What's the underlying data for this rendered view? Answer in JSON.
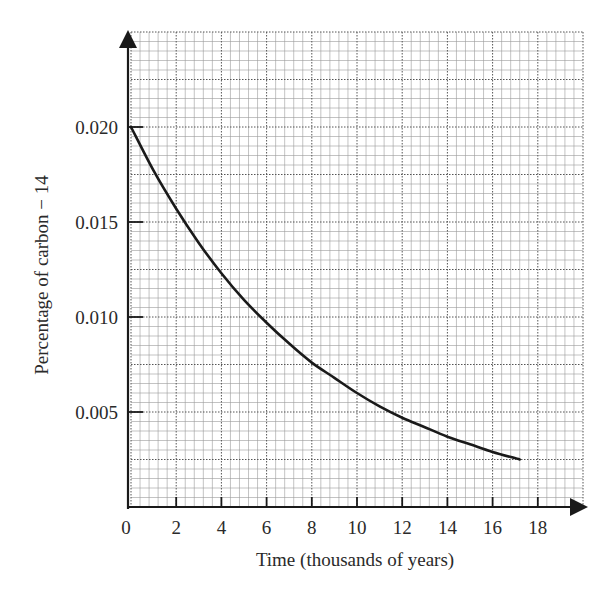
{
  "chart_data": {
    "type": "line",
    "title": "",
    "xlabel": "Time (thousands of years)",
    "ylabel": "Percentage of carbon − 14",
    "xlim": [
      0,
      20
    ],
    "ylim": [
      0,
      0.025
    ],
    "grid": true,
    "legend": null,
    "x_ticks": [
      0,
      2,
      4,
      6,
      8,
      10,
      12,
      14,
      16,
      18
    ],
    "x_tick_labels": [
      "0",
      "2",
      "4",
      "6",
      "8",
      "10",
      "12",
      "14",
      "16",
      "18"
    ],
    "y_ticks": [
      0.005,
      0.01,
      0.015,
      0.02
    ],
    "y_tick_labels": [
      "0.005",
      "0.010",
      "0.015",
      "0.020"
    ],
    "series": [
      {
        "name": "Carbon-14 decay",
        "x": [
          0,
          1,
          2,
          3,
          4,
          5,
          6,
          7,
          8,
          9,
          10,
          11,
          12,
          13,
          14,
          15,
          16,
          17.2
        ],
        "y": [
          0.02,
          0.0177,
          0.0157,
          0.0139,
          0.0123,
          0.0109,
          0.0097,
          0.0086,
          0.0076,
          0.0068,
          0.006,
          0.0053,
          0.0047,
          0.0042,
          0.0037,
          0.0033,
          0.0029,
          0.0025
        ]
      }
    ],
    "colors": {
      "curve": "#1a1a1a",
      "axis": "#1a1a1a",
      "grid_minor": "#9a9a9a",
      "grid_major": "#555555"
    }
  }
}
